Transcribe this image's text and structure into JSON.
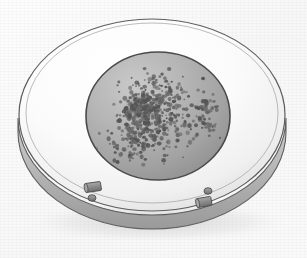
{
  "image": {
    "title": "Petri dish culture plate with bacterial colonies",
    "subject": "petri-dish",
    "style": "grayscale pencil / halftone scientific illustration",
    "width": 307,
    "height": 258
  },
  "palette": {
    "background": "#fafafa",
    "paper_shadow": "#ededed",
    "dish_rim_light": "#fcfcfc",
    "dish_rim_mid": "#e8e8e8",
    "dish_rim_shadow": "#d2d2d2",
    "dish_outline": "#5d5d5d",
    "dish_wall_top": "#bdbdbd",
    "dish_wall_bottom": "#9a9a9a",
    "agar_light": "#c3c3c3",
    "agar_mid": "#a9a9a9",
    "agar_dark": "#8e8e8e",
    "agar_outline": "#4a4a4a",
    "colony": "#6b6b6b",
    "colony_dark": "#555555",
    "confluent_patch": "#777777",
    "highlight_spot": "#d8d8d8",
    "pellet_body": "#8a8a8a",
    "pellet_shadow": "#6a6a6a",
    "pellet_cap": "#a5a5a5",
    "pellet_outline": "#4f4f4f"
  },
  "plate": {
    "outer_ellipse": {
      "cx": 152,
      "cy": 118,
      "rx": 134,
      "ry": 97
    },
    "wall_depth": 22,
    "rim_ellipse": {
      "cx": 152,
      "cy": 113,
      "rx": 126,
      "ry": 90
    },
    "agar_ellipse": {
      "cx": 158,
      "cy": 116,
      "rx": 72,
      "ry": 64
    }
  },
  "labels": {
    "plate_name": "petri-dish",
    "agar_name": "agar-surface",
    "rim_name": "dish-rim",
    "wall_name": "dish-side-wall"
  },
  "chart_data": {
    "type": "scatter",
    "xlabel": "",
    "ylabel": "",
    "units": "colony forming units (CFU)",
    "clusters": [
      {
        "name": "central-dense-cluster",
        "cx": 152,
        "cy": 112,
        "spread_x": 34,
        "spread_y": 32,
        "count": 320
      },
      {
        "name": "confluent-patch",
        "cx": 140,
        "cy": 108,
        "spread_x": 12,
        "spread_y": 11,
        "count": 90
      },
      {
        "name": "lower-left-scatter",
        "cx": 132,
        "cy": 145,
        "spread_x": 22,
        "spread_y": 16,
        "count": 70
      },
      {
        "name": "right-satellite-cluster",
        "cx": 208,
        "cy": 114,
        "spread_x": 11,
        "spread_y": 20,
        "count": 55
      },
      {
        "name": "sparse-halo",
        "cx": 156,
        "cy": 116,
        "spread_x": 56,
        "spread_y": 50,
        "count": 110
      }
    ],
    "total_colonies": 645,
    "highlight": {
      "name": "sterile-clear-spot",
      "cx": 148,
      "cy": 104,
      "r": 4
    }
  },
  "pellets": [
    {
      "name": "pellet-cylinder-left",
      "type": "cylinder",
      "cx": 93,
      "cy": 187,
      "w": 16,
      "h": 9,
      "rotation": -8
    },
    {
      "name": "pellet-disc-left",
      "type": "disc",
      "cx": 92,
      "cy": 198,
      "r": 4
    },
    {
      "name": "pellet-disc-right",
      "type": "disc",
      "cx": 208,
      "cy": 191,
      "r": 4
    },
    {
      "name": "pellet-cylinder-right",
      "type": "cylinder",
      "cx": 204,
      "cy": 202,
      "w": 15,
      "h": 9,
      "rotation": -10
    }
  ]
}
